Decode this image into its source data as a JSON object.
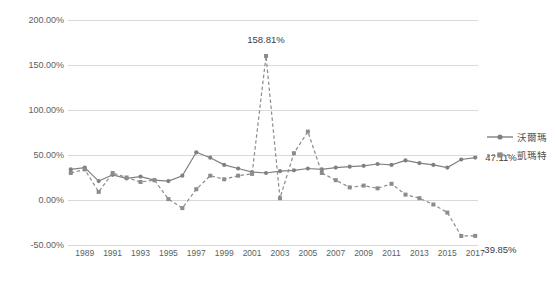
{
  "chart_data": {
    "type": "line",
    "title": "",
    "xlabel": "",
    "ylabel": "",
    "ylim": [
      -50,
      200
    ],
    "grid": true,
    "legend_position": "right",
    "ytick_labels": [
      "200.00%",
      "150.00%",
      "100.00%",
      "50.00%",
      "0.00%",
      "-50.00%"
    ],
    "ytick_values": [
      200,
      150,
      100,
      50,
      0,
      -50
    ],
    "x": [
      1988,
      1989,
      1990,
      1991,
      1992,
      1993,
      1994,
      1995,
      1996,
      1997,
      1998,
      1999,
      2000,
      2001,
      2002,
      2003,
      2004,
      2005,
      2006,
      2007,
      2008,
      2009,
      2010,
      2011,
      2012,
      2013,
      2014,
      2015,
      2016,
      2017
    ],
    "xtick_labels": [
      "1989",
      "1991",
      "1993",
      "1995",
      "1997",
      "1999",
      "2001",
      "2003",
      "2005",
      "2007",
      "2009",
      "2011",
      "2013",
      "2015",
      "2017"
    ],
    "xtick_values": [
      1989,
      1991,
      1993,
      1995,
      1997,
      1999,
      2001,
      2003,
      2005,
      2007,
      2009,
      2011,
      2013,
      2015,
      2017
    ],
    "series": [
      {
        "name": "沃爾瑪",
        "color": "#808080",
        "marker": "circle",
        "dash": "solid",
        "values": [
          34,
          36,
          21,
          28,
          24,
          26,
          22,
          21,
          27,
          53,
          47,
          39,
          35,
          31,
          30,
          32,
          33,
          35,
          34,
          36,
          37,
          38,
          40,
          39,
          44,
          41,
          39,
          36,
          45,
          47.11
        ]
      },
      {
        "name": "凱瑪特",
        "color": "#8c8c8c",
        "marker": "square",
        "dash": "dashed",
        "values": [
          30,
          34,
          9,
          30,
          25,
          20,
          22,
          1,
          -9,
          12,
          27,
          23,
          27,
          29,
          160,
          2,
          52,
          76,
          30,
          22,
          14,
          16,
          13,
          18,
          6,
          2,
          -5,
          -14,
          -40,
          -39.85
        ]
      }
    ],
    "annotations": [
      {
        "text": "158.81%",
        "x_value": 2002,
        "y_value": 160,
        "dx": 0,
        "dy": -16
      },
      {
        "text": "47.11%",
        "x_value": 2017,
        "y_value": 47.11,
        "dx": 10,
        "dy": 0
      },
      {
        "text": "-39.85%",
        "x_value": 2017,
        "y_value": -39.85,
        "dx": 6,
        "dy": 14
      }
    ]
  },
  "legend": {
    "items": [
      {
        "label": "沃爾瑪",
        "icon": "line-circle-marker"
      },
      {
        "label": "凱瑪特",
        "icon": "dashed-line-square-marker"
      }
    ]
  }
}
